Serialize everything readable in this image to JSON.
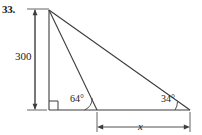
{
  "figure": {
    "problem_number": "33.",
    "type": "geometry-diagram",
    "shape": "right-triangle-with-cevian",
    "stroke_color": "#3c3c3c",
    "text_color": "#1a1a1a",
    "background_color": "#ffffff",
    "labels": {
      "vertical_dimension": "300",
      "angle_left": "64°",
      "angle_right": "34°",
      "horizontal_dimension": "x"
    },
    "annotations": {
      "right_angle_marker": "right-angle-square",
      "vertical_dimension_arrows": "double-headed",
      "horizontal_dimension_arrows": "double-headed"
    }
  }
}
